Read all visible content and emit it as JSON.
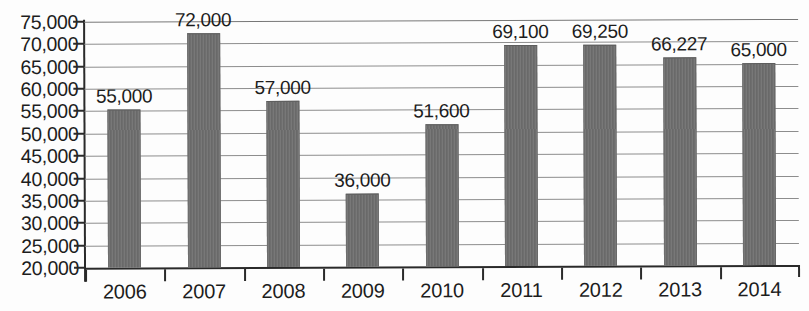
{
  "chart_data": {
    "type": "bar",
    "title": "",
    "subtitle": "",
    "xlabel": "",
    "ylabel": "",
    "categories": [
      "2006",
      "2007",
      "2008",
      "2009",
      "2010",
      "2011",
      "2012",
      "2013",
      "2014"
    ],
    "values": [
      55000,
      72000,
      57000,
      36000,
      51600,
      69100,
      69250,
      66227,
      65000
    ],
    "data_labels": [
      "55,000",
      "72,000",
      "57,000",
      "36,000",
      "51,600",
      "69,100",
      "69,250",
      "66,227",
      "65,000"
    ],
    "ylim": [
      20000,
      75000
    ],
    "ytick_values": [
      20000,
      25000,
      30000,
      35000,
      40000,
      45000,
      50000,
      55000,
      60000,
      65000,
      70000,
      75000
    ],
    "ytick_labels": [
      "20,000",
      "25,000",
      "30,000",
      "35,000",
      "40,000",
      "45,000",
      "50,000",
      "55,000",
      "60,000",
      "65,000",
      "70,000",
      "75,000"
    ],
    "grid": true,
    "grid_axis": "y",
    "legend": false,
    "legend_position": "none",
    "bar_color": "#707070",
    "axis_color": "#2a2a2a",
    "grid_color": "#8d8d8d",
    "label_color": "#1d1d1d",
    "background_color": "#fdfdfd"
  }
}
